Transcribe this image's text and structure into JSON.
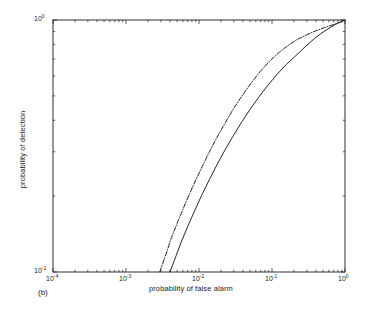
{
  "figure": {
    "caption": "(b)",
    "background_color": "#ffffff",
    "line_color": "#1a1a1a",
    "axes_box": {
      "left": 53,
      "top": 20,
      "right": 345,
      "bottom": 272
    }
  },
  "chart_data": {
    "type": "line",
    "title": "",
    "subtitle": "",
    "xlabel": "probability of false alarm",
    "ylabel": "probability of detection",
    "xscale": "log",
    "yscale": "log",
    "xlim": [
      0.0001,
      1.0
    ],
    "ylim": [
      0.1,
      1.0
    ],
    "grid": false,
    "legend": null,
    "legend_position": "none",
    "xticks": [
      0.0001,
      0.001,
      0.01,
      0.1,
      1.0
    ],
    "xtick_labels": [
      "10-4",
      "10-3",
      "10-2",
      "10-1",
      "100"
    ],
    "xtick_mantissas": [
      "10",
      "10",
      "10",
      "10",
      "10"
    ],
    "xtick_exponents": [
      "-4",
      "-3",
      "-2",
      "-1",
      "0"
    ],
    "yticks": [
      0.1,
      1.0
    ],
    "ytick_labels": [
      "10-1",
      "100"
    ],
    "ytick_mantissas": [
      "10",
      "10"
    ],
    "ytick_exponents": [
      "-1",
      "0"
    ],
    "minor_ticks": true,
    "annotations": [
      {
        "text": "(b)",
        "x": 38,
        "y": 288
      }
    ],
    "series": [
      {
        "name": "dash-dot curve",
        "style": "dashdot",
        "color": "#1a1a1a",
        "x": [
          0.0029,
          0.0035,
          0.0042,
          0.0052,
          0.0065,
          0.0082,
          0.0105,
          0.0135,
          0.0175,
          0.023,
          0.03,
          0.04,
          0.053,
          0.07,
          0.093,
          0.124,
          0.165,
          0.22,
          0.3,
          0.4,
          0.52,
          0.66,
          0.82,
          1.0
        ],
        "y": [
          0.1,
          0.117,
          0.137,
          0.16,
          0.187,
          0.218,
          0.254,
          0.295,
          0.341,
          0.392,
          0.447,
          0.506,
          0.567,
          0.628,
          0.687,
          0.742,
          0.792,
          0.836,
          0.874,
          0.906,
          0.932,
          0.954,
          0.975,
          1.0
        ]
      },
      {
        "name": "solid curve",
        "style": "solid",
        "color": "#1a1a1a",
        "x": [
          0.004,
          0.0048,
          0.0058,
          0.0071,
          0.0088,
          0.011,
          0.0139,
          0.0177,
          0.0227,
          0.0294,
          0.0383,
          0.0503,
          0.0665,
          0.0884,
          0.118,
          0.158,
          0.212,
          0.285,
          0.383,
          0.5,
          0.63,
          0.78,
          0.9,
          1.0
        ],
        "y": [
          0.1,
          0.115,
          0.133,
          0.153,
          0.176,
          0.203,
          0.233,
          0.267,
          0.305,
          0.347,
          0.393,
          0.443,
          0.496,
          0.552,
          0.61,
          0.667,
          0.722,
          0.783,
          0.845,
          0.895,
          0.935,
          0.968,
          0.986,
          1.0
        ]
      }
    ]
  }
}
